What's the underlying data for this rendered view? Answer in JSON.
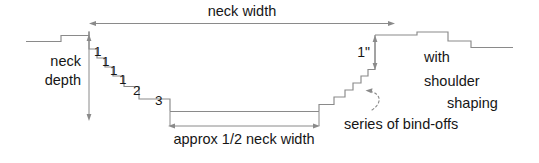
{
  "diagram": {
    "stroke_color": "#8a8a8a",
    "text_color": "#161616",
    "background_color": "#ffffff",
    "labels": {
      "neck_width": "neck width",
      "neck_depth_line1": "neck",
      "neck_depth_line2": "depth",
      "half_neck_width": "approx 1/2 neck width",
      "bind_offs": "series of bind-offs",
      "one_inch": "1\"",
      "shoulder_line1": "with",
      "shoulder_line2": "shoulder",
      "shoulder_line3": "shaping"
    },
    "left_decrease_steps": [
      "1",
      "1",
      "1",
      "1",
      "2",
      "3"
    ],
    "dimensions": [
      {
        "name": "neck-width",
        "label": "neck width",
        "orientation": "horizontal"
      },
      {
        "name": "neck-depth",
        "label": "neck depth",
        "orientation": "vertical"
      },
      {
        "name": "approx-half-neck-width",
        "label": "approx 1/2 neck width",
        "orientation": "horizontal"
      },
      {
        "name": "one-inch-shoulder",
        "label": "1\"",
        "orientation": "vertical"
      }
    ]
  }
}
